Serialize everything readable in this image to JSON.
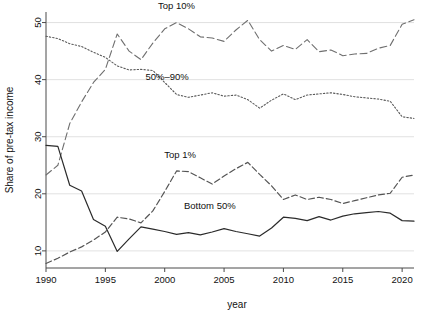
{
  "chart_data": {
    "type": "line",
    "title": "",
    "xlabel": "year",
    "ylabel": "Share of pre-tax income",
    "xlim": [
      1990,
      2021
    ],
    "ylim": [
      7,
      51.5
    ],
    "grid": true,
    "grid_axis": "y",
    "legend": "inline-annotations",
    "xticks": [
      1990,
      1995,
      2000,
      2005,
      2010,
      2015,
      2020
    ],
    "xticklabels": [
      "1990",
      "1995",
      "2000",
      "2005",
      "2010",
      "2015",
      "2020"
    ],
    "yticks": [
      10,
      20,
      30,
      40,
      50
    ],
    "yticklabels": [
      "10",
      "20",
      "30",
      "40",
      "50"
    ],
    "x": [
      1990,
      1991,
      1992,
      1993,
      1994,
      1995,
      1996,
      1997,
      1998,
      1999,
      2000,
      2001,
      2002,
      2003,
      2004,
      2005,
      2006,
      2007,
      2008,
      2009,
      2010,
      2011,
      2012,
      2013,
      2014,
      2015,
      2016,
      2017,
      2018,
      2019,
      2020,
      2021
    ],
    "series": [
      {
        "name": "Top 10%",
        "style": "long-dash",
        "label_text": "Top 10%",
        "label_x": 2001,
        "label_y": 52.3,
        "values": [
          23.3,
          25.0,
          32.3,
          36.1,
          39.5,
          41.8,
          48.0,
          45.0,
          43.5,
          46.4,
          48.9,
          50.0,
          48.9,
          47.5,
          47.3,
          46.7,
          48.7,
          50.4,
          47.0,
          45.0,
          46.0,
          45.3,
          47.0,
          44.9,
          45.2,
          44.2,
          44.5,
          44.6,
          45.5,
          46.0,
          49.7,
          50.5
        ]
      },
      {
        "name": "50%-90%",
        "style": "dotted",
        "label_text": "50%–90%",
        "label_x": 2000.2,
        "label_y": 40.0,
        "values": [
          47.6,
          47.2,
          46.3,
          45.8,
          44.8,
          43.9,
          42.4,
          41.7,
          41.8,
          41.6,
          39.5,
          37.4,
          36.9,
          37.3,
          37.7,
          37.1,
          37.3,
          36.5,
          35.0,
          36.4,
          37.5,
          36.5,
          37.3,
          37.5,
          37.7,
          37.4,
          37.0,
          36.8,
          36.6,
          36.2,
          33.5,
          33.2
        ]
      },
      {
        "name": "Top 1%",
        "style": "dash",
        "label_text": "Top 1%",
        "label_x": 2001.3,
        "label_y": 26.2,
        "values": [
          7.8,
          8.7,
          9.8,
          10.7,
          11.9,
          13.3,
          15.9,
          15.6,
          14.9,
          17.0,
          20.4,
          24.0,
          23.9,
          22.8,
          21.7,
          23.1,
          24.4,
          25.5,
          23.4,
          21.4,
          19.0,
          19.8,
          19.0,
          19.4,
          19.0,
          18.3,
          18.8,
          19.3,
          19.8,
          20.1,
          22.9,
          23.3
        ]
      },
      {
        "name": "Bottom 50%",
        "style": "solid",
        "label_text": "Bottom 50%",
        "label_x": 2003.8,
        "label_y": 17.4,
        "values": [
          28.5,
          28.3,
          21.5,
          20.5,
          15.5,
          14.3,
          9.9,
          12.1,
          14.2,
          13.8,
          13.4,
          12.9,
          13.2,
          12.8,
          13.3,
          13.9,
          13.4,
          13.0,
          12.6,
          14.0,
          15.9,
          15.7,
          15.3,
          16.0,
          15.4,
          16.1,
          16.5,
          16.7,
          16.9,
          16.6,
          15.3,
          15.2
        ]
      }
    ]
  }
}
